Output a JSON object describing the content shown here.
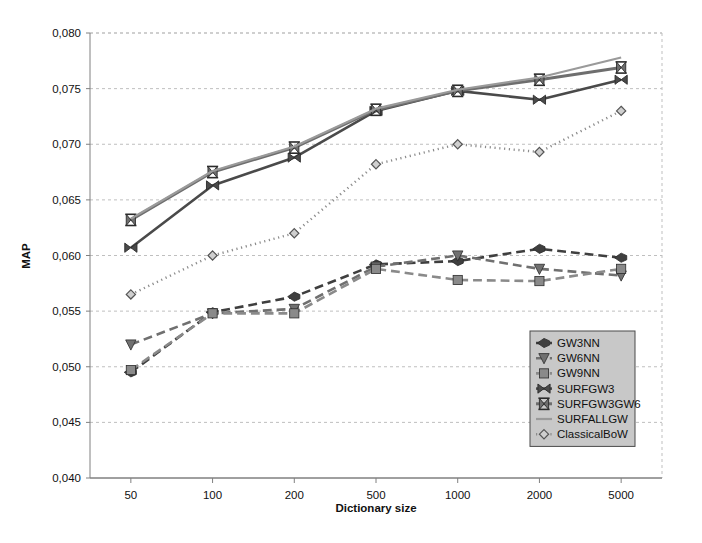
{
  "chart_data": {
    "type": "line",
    "title": "",
    "xlabel": "Dictionary size",
    "ylabel": "MAP",
    "x_tick_labels": [
      "50",
      "100",
      "200",
      "500",
      "1000",
      "2000",
      "5000"
    ],
    "categories": [
      50,
      100,
      200,
      500,
      1000,
      2000,
      5000
    ],
    "x_scale": "categorical",
    "y_tick_labels": [
      "0,040",
      "0,045",
      "0,050",
      "0,055",
      "0,060",
      "0,065",
      "0,070",
      "0,075",
      "0,080"
    ],
    "y_ticks": [
      0.04,
      0.045,
      0.05,
      0.055,
      0.06,
      0.065,
      0.07,
      0.075,
      0.08
    ],
    "ylim": [
      0.04,
      0.08
    ],
    "grid": "horizontal",
    "decimal_separator": ",",
    "legend_position": "bottom-right",
    "series": [
      {
        "name": "GW3NN",
        "values": [
          0.0495,
          0.0549,
          0.0563,
          0.0592,
          0.0595,
          0.0606,
          0.0598
        ],
        "color": "#3f3f3f",
        "style": "dashed",
        "width": 2.6,
        "marker": "arrow-left"
      },
      {
        "name": "GW6NN",
        "values": [
          0.052,
          0.0548,
          0.0552,
          0.059,
          0.06,
          0.0588,
          0.0582
        ],
        "color": "#707070",
        "style": "dashed",
        "width": 2.6,
        "marker": "triangle-down"
      },
      {
        "name": "GW9NN",
        "values": [
          0.0497,
          0.0548,
          0.0548,
          0.0588,
          0.0578,
          0.0577,
          0.0588
        ],
        "color": "#8a8a8a",
        "style": "dashed",
        "width": 2.6,
        "marker": "square"
      },
      {
        "name": "SURFGW3",
        "values": [
          0.0607,
          0.0663,
          0.0688,
          0.073,
          0.0748,
          0.074,
          0.0758
        ],
        "color": "#4a4a4a",
        "style": "solid",
        "width": 2.6,
        "marker": "bowtie"
      },
      {
        "name": "SURFGW3GW6",
        "values": [
          0.0632,
          0.0675,
          0.0697,
          0.0731,
          0.0748,
          0.0758,
          0.0769
        ],
        "color": "#6e6e6e",
        "style": "solid",
        "width": 3.0,
        "marker": "x-bar"
      },
      {
        "name": "SURFALLGW",
        "values": [
          0.0633,
          0.0676,
          0.0698,
          0.0732,
          0.0749,
          0.076,
          0.0778
        ],
        "color": "#9a9a9a",
        "style": "solid",
        "width": 2.2,
        "marker": "none"
      },
      {
        "name": "ClassicalBoW",
        "values": [
          0.0565,
          0.06,
          0.062,
          0.0682,
          0.07,
          0.0693,
          0.073
        ],
        "color": "#8c8c8c",
        "style": "dotted",
        "width": 2.4,
        "marker": "diamond-open"
      }
    ]
  },
  "legend": {
    "items": [
      {
        "label": "GW3NN"
      },
      {
        "label": "GW6NN"
      },
      {
        "label": "GW9NN"
      },
      {
        "label": "SURFGW3"
      },
      {
        "label": "SURFGW3GW6"
      },
      {
        "label": "SURFALLGW"
      },
      {
        "label": "ClassicalBoW"
      }
    ]
  },
  "colors": {
    "background": "#ffffff",
    "grid": "#bfbfbf",
    "axis": "#808080",
    "legend_fill": "#c8c8c8",
    "legend_border": "#4a4a4a",
    "text": "#111111"
  }
}
